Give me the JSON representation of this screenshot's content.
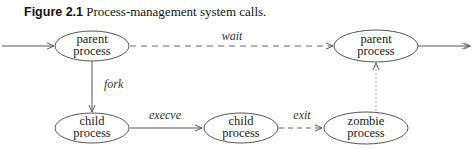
{
  "figure": {
    "number": "Figure 2.1",
    "caption": "Process-management system calls."
  },
  "colors": {
    "stroke": "#555555",
    "text": "#222222",
    "background": "#ffffff"
  },
  "nodes": [
    {
      "id": "parent1",
      "line1": "parent",
      "line2": "process"
    },
    {
      "id": "child1",
      "line1": "child",
      "line2": "process"
    },
    {
      "id": "child2",
      "line1": "child",
      "line2": "process"
    },
    {
      "id": "zombie",
      "line1": "zombie",
      "line2": "process"
    },
    {
      "id": "parent2",
      "line1": "parent",
      "line2": "process"
    }
  ],
  "edges": [
    {
      "from": "entry",
      "to": "parent1",
      "label": "",
      "style": "solid"
    },
    {
      "from": "parent1",
      "to": "parent2",
      "label": "wait",
      "style": "dashed"
    },
    {
      "from": "parent1",
      "to": "child1",
      "label": "fork",
      "style": "solid"
    },
    {
      "from": "child1",
      "to": "child2",
      "label": "execve",
      "style": "solid"
    },
    {
      "from": "child2",
      "to": "zombie",
      "label": "exit",
      "style": "dashed"
    },
    {
      "from": "zombie",
      "to": "parent2",
      "label": "",
      "style": "dotted"
    },
    {
      "from": "parent2",
      "to": "exit",
      "label": "",
      "style": "solid"
    }
  ]
}
